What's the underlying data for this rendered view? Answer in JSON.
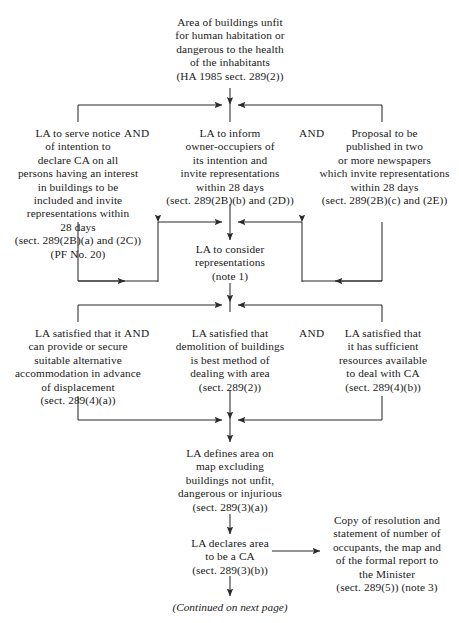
{
  "diagram": {
    "title_node": {
      "id": "area-unfit",
      "lines": [
        "Area of buildings unfit",
        "for human habitation or",
        "dangerous to the health",
        "of the inhabitants",
        "(HA 1985 sect. 289(2))"
      ]
    },
    "row1": {
      "left": {
        "id": "serve-notice",
        "lines": [
          "LA to serve notice",
          "of intention to",
          "declare CA on all",
          "persons having an interest",
          "in buildings to be",
          "included and invite",
          "representations within",
          "28 days",
          "(sect. 289(2B)(a) and (2C))",
          "(PF No. 20)"
        ]
      },
      "middle": {
        "id": "inform-owner-occupiers",
        "lines": [
          "LA to inform",
          "owner-occupiers of",
          "its intention and",
          "invite representations",
          "within 28 days",
          "(sect. 289(2B)(b) and (2D))"
        ]
      },
      "right": {
        "id": "publish-newspapers",
        "lines": [
          "Proposal to be",
          "published in two",
          "or more newspapers",
          "which invite representations",
          "within 28 days",
          "(sect. 289(2B)(c) and (2E))"
        ]
      },
      "connector_left": "AND",
      "connector_right": "AND"
    },
    "consider": {
      "id": "consider-representations",
      "lines": [
        "LA to consider",
        "representations",
        "(note 1)"
      ]
    },
    "row2": {
      "left": {
        "id": "satisfied-accommodation",
        "lines": [
          "LA satisfied that it",
          "can provide or secure",
          "suitable alternative",
          "accommodation in advance",
          "of displacement",
          "(sect. 289(4)(a))"
        ]
      },
      "middle": {
        "id": "satisfied-demolition",
        "lines": [
          "LA satisfied that",
          "demolition of buildings",
          "is best method of",
          "dealing with area",
          "(sect. 289(2))"
        ]
      },
      "right": {
        "id": "satisfied-resources",
        "lines": [
          "LA satisfied that",
          "it has sufficient",
          "resources available",
          "to deal with CA",
          "(sect. 289(4)(b))"
        ]
      },
      "connector_left": "AND",
      "connector_right": "AND"
    },
    "defines_area": {
      "id": "defines-area-on-map",
      "lines": [
        "LA defines area on",
        "map excluding",
        "buildings not unfit,",
        "dangerous or injurious",
        "(sect. 289(3)(a))"
      ]
    },
    "declares_ca": {
      "id": "declares-area-ca",
      "lines": [
        "LA declares area",
        "to be a CA",
        "(sect. 289(3)(b))"
      ]
    },
    "copy_resolution": {
      "id": "copy-of-resolution",
      "lines": [
        "Copy of resolution and",
        "statement of number of",
        "occupants, the map and",
        "of the formal report to",
        "the Minister",
        "(sect. 289(5)) (note 3)"
      ]
    },
    "footer": {
      "id": "continued-next-page",
      "text": "(Continued on next page)"
    },
    "colors": {
      "background": "#ffffff",
      "text": "#1a1a1a",
      "line": "#2b2b2b"
    }
  }
}
